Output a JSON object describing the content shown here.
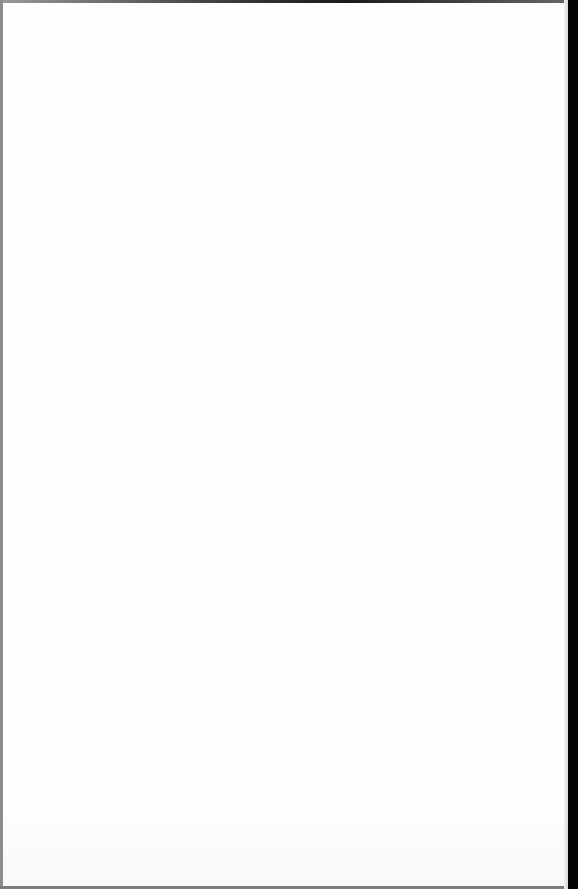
{
  "document": {
    "type": "blank scanned page",
    "visible_text": "",
    "colors": {
      "paper": "#fefefe",
      "scan_border_right": "#050505",
      "scan_border_top": "#1a1a1a",
      "scan_border_left": "#8c8c8c",
      "scan_border_bottom": "#7a7a7a"
    }
  }
}
